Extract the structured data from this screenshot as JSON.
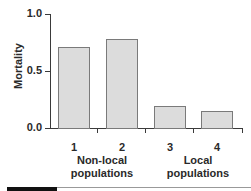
{
  "chart_data": {
    "type": "bar",
    "title": "",
    "xlabel": "",
    "ylabel": "Mortality",
    "ylim": [
      0.0,
      1.0
    ],
    "yticks": [
      "0.0",
      "0.5",
      "1.0"
    ],
    "grid": false,
    "categories": [
      "1",
      "2",
      "3",
      "4"
    ],
    "values": [
      0.71,
      0.78,
      0.19,
      0.15
    ],
    "groups": [
      {
        "label": "Non-local populations",
        "categories": [
          "1",
          "2"
        ]
      },
      {
        "label": "Local populations",
        "categories": [
          "3",
          "4"
        ]
      }
    ],
    "bar_color": "#dcdcdc"
  },
  "axis": {
    "ylabel": "Mortality",
    "ytick_0": "0.0",
    "ytick_05": "0.5",
    "ytick_1": "1.0"
  },
  "xcats": [
    "1",
    "2",
    "3",
    "4"
  ],
  "groups": {
    "nonlocal_line1": "Non-local",
    "nonlocal_line2": "populations",
    "local_line1": "Local",
    "local_line2": "populations"
  }
}
